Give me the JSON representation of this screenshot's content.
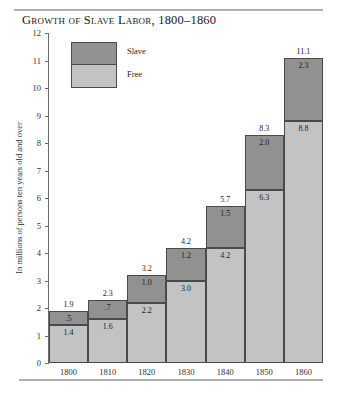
{
  "figure": {
    "title": "Growth of Slave Labor, 1800–1860"
  },
  "legend": {
    "slave_label": "Slave",
    "free_label": "Free",
    "slave_color": "#919191",
    "free_color": "#c3c3c3"
  },
  "axes": {
    "ylabel": "In millions of persons ten years old and over",
    "yticks": [
      "12",
      "11",
      "10",
      "9",
      "8",
      "7",
      "6",
      "5",
      "4",
      "3",
      "2",
      "1",
      "0"
    ]
  },
  "chart_data": {
    "type": "bar",
    "title": "Growth of Slave Labor, 1800–1860",
    "xlabel": "",
    "ylabel": "In millions of persons ten years old and over",
    "ylim": [
      0,
      12
    ],
    "ytick_step": 1,
    "grid": false,
    "stacked": true,
    "legend_position": "inside-top-left",
    "categories": [
      "1800",
      "1810",
      "1820",
      "1830",
      "1840",
      "1850",
      "1860"
    ],
    "series": [
      {
        "name": "Free",
        "color": "#c3c3c3",
        "values": [
          1.4,
          1.6,
          2.2,
          3.0,
          4.2,
          6.3,
          8.8
        ],
        "labels": [
          "1.4",
          "1.6",
          "2.2",
          "3.0",
          "4.2",
          "6.3",
          "8.8"
        ]
      },
      {
        "name": "Slave",
        "color": "#919191",
        "values": [
          0.5,
          0.7,
          1.0,
          1.2,
          1.5,
          2.0,
          2.3
        ],
        "labels": [
          ".5",
          ".7",
          "1.0",
          "1.2",
          "1.5",
          "2.0",
          "2.3"
        ]
      }
    ],
    "totals": [
      1.9,
      2.3,
      3.2,
      4.2,
      5.7,
      8.3,
      11.1
    ],
    "total_labels": [
      "1.9",
      "2.3",
      "3.2",
      "4.2",
      "5.7",
      "8.3",
      "11.1"
    ]
  }
}
